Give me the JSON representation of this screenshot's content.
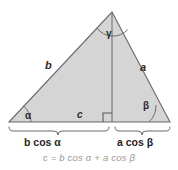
{
  "figure": {
    "background_color": "#ffffff",
    "fill_color": "#d5d5d5",
    "stroke_color": "#6b6b6b",
    "equation_color": "#9a9a9a",
    "sides": {
      "left_label": "b",
      "right_label": "a",
      "base_label": "c"
    },
    "angles": {
      "left_label": "α",
      "right_label": "β",
      "apex_label": "γ"
    },
    "segments": {
      "left_label": "b cos α",
      "right_label": "a cos β"
    },
    "equation": "c = b cos α + a cos β"
  }
}
